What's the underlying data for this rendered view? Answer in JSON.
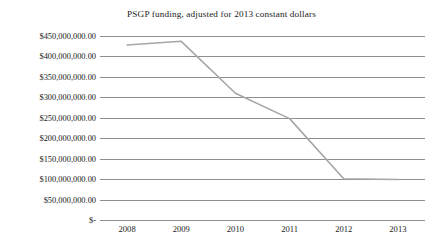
{
  "chart_data": {
    "type": "line",
    "title": "PSGP funding, adjusted for 2013 constant dollars",
    "xlabel": "",
    "ylabel": "",
    "categories": [
      "2008",
      "2009",
      "2010",
      "2011",
      "2012",
      "2013"
    ],
    "values": [
      428000000,
      437000000,
      310000000,
      248000000,
      101000000,
      99000000
    ],
    "series": [
      {
        "name": "PSGP funding",
        "color": "#a6a6a6",
        "values": [
          428000000,
          437000000,
          310000000,
          248000000,
          101000000,
          99000000
        ]
      }
    ],
    "ylim": [
      0,
      450000000
    ],
    "ytick_values": [
      450000000,
      400000000,
      350000000,
      300000000,
      250000000,
      200000000,
      150000000,
      100000000,
      50000000,
      0
    ],
    "ytick_labels": [
      "$450,000,000.00",
      "$400,000,000.00",
      "$350,000,000.00",
      "$300,000,000.00",
      "$250,000,000.00",
      "$200,000,000.00",
      "$150,000,000.00",
      "$100,000,000.00",
      "$50,000,000.00",
      "$-"
    ],
    "xtick_labels": [
      "2008",
      "2009",
      "2010",
      "2011",
      "2012",
      "2013"
    ],
    "grid": true,
    "grid_color": "#8e8e8e",
    "legend": false,
    "legend_position": "none",
    "background_color": "#ffffff"
  }
}
